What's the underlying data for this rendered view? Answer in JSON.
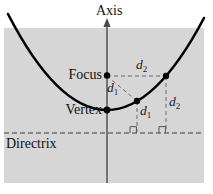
{
  "diagram": {
    "labels": {
      "axis": "Axis",
      "focus": "Focus",
      "vertex": "Vertex",
      "directrix": "Directrix",
      "d1": {
        "base": "d",
        "sub": "1"
      },
      "d2": {
        "base": "d",
        "sub": "2"
      }
    },
    "colors": {
      "panel": "#d6d6d6",
      "curve": "#000000",
      "axis_line": "#4a4a4a",
      "guide_dash": "#6a6a6a",
      "directrix_line": "#3f3f3f",
      "text": "#111111"
    }
  }
}
